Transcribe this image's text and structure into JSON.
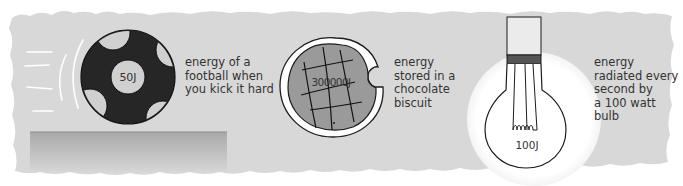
{
  "colors": {
    "panel": "#d8d8d8",
    "dark": "#262626",
    "biscuit": "#9a9a9a",
    "bulb_glow": "#ffffff",
    "band": "#555555",
    "text": "#333333"
  },
  "items": [
    {
      "id": "football",
      "value_label": "50J",
      "caption": "energy of a\nfootball when\nyou kick it hard"
    },
    {
      "id": "biscuit",
      "value_label": "300000J",
      "caption": "energy\nstored in a\nchocolate\nbiscuit"
    },
    {
      "id": "bulb",
      "value_label": "100J",
      "caption": "energy\nradiated every\nsecond by\na 100 watt\nbulb"
    }
  ]
}
